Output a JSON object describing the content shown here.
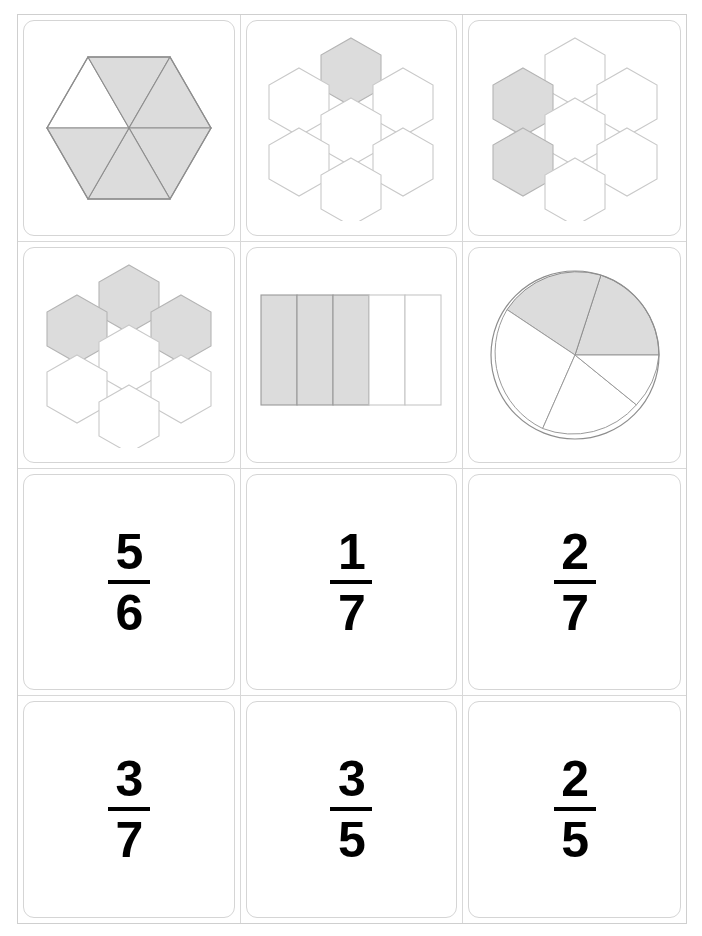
{
  "sheet": {
    "title": "Fraction Matching Cards",
    "columns": 3,
    "rows": 4,
    "shade_color": "#dcdcdc",
    "stroke_color": "#9a9a9a",
    "card_border_color": "#d5d5d5",
    "grid_line_color": "#d8d8d8"
  },
  "cards": [
    {
      "id": "card-1",
      "position": "row1-col1",
      "kind": "figure",
      "figure": "hexagon-six-triangles",
      "label": "hexagon split into 6 triangles",
      "numerator": 5,
      "denominator": 6,
      "shaded_parts": 5,
      "total_parts": 6,
      "shaded_indices": [
        1,
        2,
        3,
        4,
        5
      ],
      "fraction_text": "5/6"
    },
    {
      "id": "card-2",
      "position": "row1-col2",
      "kind": "figure",
      "figure": "hexagon-flower-seven",
      "label": "seven hexagons, one shaded",
      "numerator": 1,
      "denominator": 7,
      "shaded_parts": 1,
      "total_parts": 7,
      "shaded_indices": [
        0
      ],
      "fraction_text": "1/7"
    },
    {
      "id": "card-3",
      "position": "row1-col3",
      "kind": "figure",
      "figure": "hexagon-flower-seven",
      "label": "seven hexagons, two shaded",
      "numerator": 2,
      "denominator": 7,
      "shaded_parts": 2,
      "total_parts": 7,
      "shaded_indices": [
        1,
        3
      ],
      "fraction_text": "2/7"
    },
    {
      "id": "card-4",
      "position": "row2-col1",
      "kind": "figure",
      "figure": "hexagon-flower-seven",
      "label": "seven hexagons, three shaded",
      "numerator": 3,
      "denominator": 7,
      "shaded_parts": 3,
      "total_parts": 7,
      "shaded_indices": [
        0,
        1,
        2
      ],
      "fraction_text": "3/7"
    },
    {
      "id": "card-5",
      "position": "row2-col2",
      "kind": "figure",
      "figure": "rectangle-five-strips",
      "label": "rectangle split into 5 strips, 3 shaded",
      "numerator": 3,
      "denominator": 5,
      "shaded_parts": 3,
      "total_parts": 5,
      "shaded_indices": [
        0,
        1,
        2
      ],
      "fraction_text": "3/5"
    },
    {
      "id": "card-6",
      "position": "row2-col3",
      "kind": "figure",
      "figure": "pie-five-sectors",
      "label": "circle split into 5 sectors, 2 shaded",
      "numerator": 2,
      "denominator": 5,
      "shaded_parts": 2,
      "total_parts": 5,
      "shaded_indices": [
        0,
        1
      ],
      "fraction_text": "2/5"
    },
    {
      "id": "card-7",
      "position": "row3-col1",
      "kind": "fraction",
      "numerator": "5",
      "denominator": "6",
      "fraction_text": "5/6"
    },
    {
      "id": "card-8",
      "position": "row3-col2",
      "kind": "fraction",
      "numerator": "1",
      "denominator": "7",
      "fraction_text": "1/7"
    },
    {
      "id": "card-9",
      "position": "row3-col3",
      "kind": "fraction",
      "numerator": "2",
      "denominator": "7",
      "fraction_text": "2/7"
    },
    {
      "id": "card-10",
      "position": "row4-col1",
      "kind": "fraction",
      "numerator": "3",
      "denominator": "7",
      "fraction_text": "3/7"
    },
    {
      "id": "card-11",
      "position": "row4-col2",
      "kind": "fraction",
      "numerator": "3",
      "denominator": "5",
      "fraction_text": "3/5"
    },
    {
      "id": "card-12",
      "position": "row4-col3",
      "kind": "fraction",
      "numerator": "2",
      "denominator": "5",
      "fraction_text": "2/5"
    }
  ]
}
